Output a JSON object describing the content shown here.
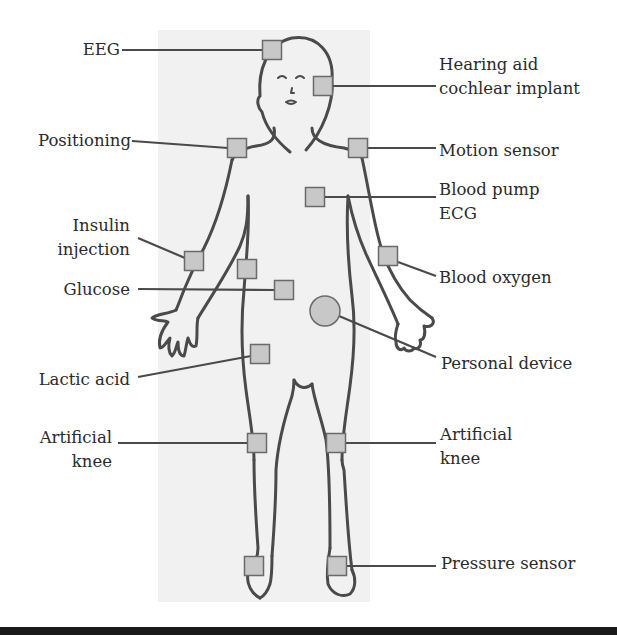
{
  "diagram": {
    "colors": {
      "outline": "#4a4a4a",
      "sensor_fill": "#c8c8c8",
      "sensor_stroke": "#6a6a6a",
      "leader_line": "#4a4a4a",
      "text": "#2a2a2a",
      "panel": "#f1f1f1"
    },
    "labels": [
      {
        "id": "eeg",
        "text": "EEG",
        "side": "left"
      },
      {
        "id": "hearing",
        "text": "Hearing aid\ncochlear implant",
        "side": "right"
      },
      {
        "id": "positioning",
        "text": "Positioning",
        "side": "left"
      },
      {
        "id": "motion",
        "text": "Motion sensor",
        "side": "right"
      },
      {
        "id": "bloodpump",
        "text": "Blood pump\nECG",
        "side": "right"
      },
      {
        "id": "insulin",
        "text": "Insulin\ninjection",
        "side": "left"
      },
      {
        "id": "glucose",
        "text": "Glucose",
        "side": "left"
      },
      {
        "id": "bloodoxygen",
        "text": "Blood oxygen",
        "side": "right"
      },
      {
        "id": "personal",
        "text": "Personal device",
        "side": "right"
      },
      {
        "id": "lactic",
        "text": "Lactic acid",
        "side": "left"
      },
      {
        "id": "knee_left",
        "text": "Artificial\nknee",
        "side": "left"
      },
      {
        "id": "knee_right",
        "text": "Artificial\nknee",
        "side": "right"
      },
      {
        "id": "pressure",
        "text": "Pressure sensor",
        "side": "right"
      }
    ],
    "sensors": [
      {
        "id": "eeg",
        "shape": "square",
        "x": 272,
        "y": 50
      },
      {
        "id": "hearing",
        "shape": "square",
        "x": 323,
        "y": 86
      },
      {
        "id": "positioning",
        "shape": "square",
        "x": 237,
        "y": 148
      },
      {
        "id": "motion",
        "shape": "square",
        "x": 358,
        "y": 148
      },
      {
        "id": "bloodpump",
        "shape": "square",
        "x": 315,
        "y": 197
      },
      {
        "id": "insulin",
        "shape": "square",
        "x": 194,
        "y": 261
      },
      {
        "id": "lower_chest",
        "shape": "square",
        "x": 247,
        "y": 269
      },
      {
        "id": "glucose",
        "shape": "square",
        "x": 284,
        "y": 290
      },
      {
        "id": "bloodoxygen",
        "shape": "square",
        "x": 388,
        "y": 256
      },
      {
        "id": "personal",
        "shape": "circle",
        "x": 325,
        "y": 311
      },
      {
        "id": "lactic",
        "shape": "square",
        "x": 260,
        "y": 354
      },
      {
        "id": "knee_left",
        "shape": "square",
        "x": 257,
        "y": 443
      },
      {
        "id": "knee_right",
        "shape": "square",
        "x": 336,
        "y": 443
      },
      {
        "id": "foot_left",
        "shape": "square",
        "x": 254,
        "y": 566
      },
      {
        "id": "foot_right",
        "shape": "square",
        "x": 337,
        "y": 566
      }
    ]
  }
}
